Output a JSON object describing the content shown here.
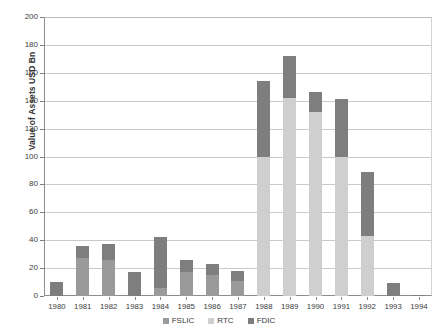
{
  "chart_data": {
    "type": "bar",
    "stacked": true,
    "title": "",
    "xlabel": "",
    "ylabel": "Value of Assets USD Bn",
    "ylim": [
      0,
      200
    ],
    "ytick_step": 20,
    "yticks": [
      200,
      180,
      160,
      140,
      120,
      100,
      80,
      60,
      40,
      20,
      0
    ],
    "grid": true,
    "legend_position": "bottom-center",
    "categories": [
      "1980",
      "1981",
      "1982",
      "1983",
      "1984",
      "1985",
      "1986",
      "1987",
      "1988",
      "1989",
      "1990",
      "1991",
      "1992",
      "1993",
      "1994"
    ],
    "series": [
      {
        "name": "FSLIC",
        "color": "#9a9a9a",
        "values": [
          0,
          27,
          26,
          0,
          6,
          17,
          15,
          11,
          0,
          0,
          0,
          0,
          0,
          0,
          0
        ]
      },
      {
        "name": "RTC",
        "color": "#cfcfcf",
        "values": [
          0,
          0,
          0,
          0,
          0,
          0,
          0,
          0,
          100,
          142,
          132,
          100,
          43,
          0,
          0
        ]
      },
      {
        "name": "FDIC",
        "color": "#7e7e7e",
        "values": [
          10,
          9,
          11,
          17,
          36,
          9,
          8,
          7,
          54,
          30,
          14,
          41,
          46,
          9,
          1
        ]
      }
    ],
    "totals": [
      10,
      36,
      37,
      17,
      42,
      26,
      23,
      18,
      154,
      172,
      146,
      141,
      89,
      9,
      1
    ]
  },
  "legend": {
    "items": [
      {
        "label": "FSLIC",
        "color": "#9a9a9a"
      },
      {
        "label": "RTC",
        "color": "#cfcfcf"
      },
      {
        "label": "FDIC",
        "color": "#7e7e7e"
      }
    ]
  }
}
